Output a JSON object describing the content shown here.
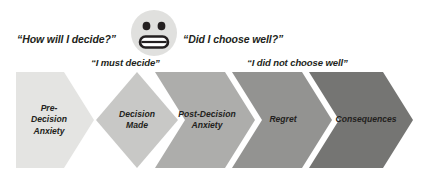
{
  "diagram": {
    "face": {
      "icon": "grimacing-face-icon",
      "bg_color": "#e0e0de",
      "feature_color": "#231f20"
    },
    "quotes": [
      {
        "id": "how-will-i-decide",
        "text": "“How will I decide?”"
      },
      {
        "id": "i-must-decide",
        "text": "“I must decide”"
      },
      {
        "id": "did-i-choose-well",
        "text": "“Did I choose well?”"
      },
      {
        "id": "i-did-not-choose-well",
        "text": "“I did not choose well”"
      }
    ],
    "stages": [
      {
        "id": "pre-decision-anxiety",
        "label": "Pre-\nDecision\nAnxiety",
        "color": "#e4e4e2",
        "shape": "pentagon-right"
      },
      {
        "id": "decision-made",
        "label": "Decision\nMade",
        "color": "#c8c8c6",
        "shape": "diamond"
      },
      {
        "id": "post-decision-anxiety",
        "label": "Post-Decision\nAnxiety",
        "color": "#adadab",
        "shape": "chevron"
      },
      {
        "id": "regret",
        "label": "Regret",
        "color": "#939391",
        "shape": "chevron"
      },
      {
        "id": "consequences",
        "label": "Consequences",
        "color": "#757573",
        "shape": "chevron"
      }
    ]
  }
}
